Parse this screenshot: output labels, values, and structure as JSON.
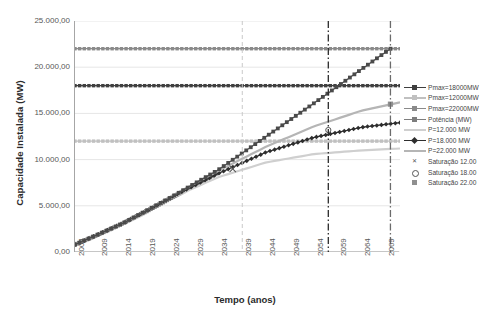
{
  "chart_data": {
    "type": "line",
    "title": "",
    "xlabel": "Tempo (anos)",
    "ylabel": "Capacidade Instalada (MW)",
    "xlim": [
      2004,
      2072
    ],
    "ylim": [
      0,
      25000
    ],
    "grid": true,
    "legend_position": "right",
    "x_ticks": [
      "2004",
      "2009",
      "2014",
      "2019",
      "2024",
      "2029",
      "2034",
      "2039",
      "2044",
      "2049",
      "2054",
      "2059",
      "2064",
      "2069"
    ],
    "y_ticks": [
      "0,00",
      "5.000,00",
      "10.000,00",
      "15.000,00",
      "20.000,00",
      "25.000,00"
    ],
    "annotations": [
      {
        "name": "vertical-reference-2039",
        "x": 2039,
        "style": "dashed",
        "color": "#c9c9c9"
      },
      {
        "name": "vertical-reference-2057",
        "x": 2057,
        "style": "dash-dot",
        "color": "#2b2b2b"
      },
      {
        "name": "vertical-reference-2070",
        "x": 2070,
        "style": "dash-dot",
        "color": "#6b6b6b"
      }
    ],
    "series": [
      {
        "name": "Pmax=18000MW",
        "color": "#3f3f3f",
        "marker": "square",
        "type": "horizontal-line",
        "x": [
          2004,
          2072
        ],
        "values": [
          18000,
          18000
        ]
      },
      {
        "name": "Pmax=12000MW",
        "color": "#c0c0c0",
        "marker": "square",
        "type": "horizontal-line",
        "x": [
          2004,
          2072
        ],
        "values": [
          12000,
          12000
        ]
      },
      {
        "name": "Pmax=22000MW",
        "color": "#8a8a8a",
        "marker": "square",
        "type": "horizontal-line",
        "x": [
          2004,
          2072
        ],
        "values": [
          22000,
          22000
        ]
      },
      {
        "name": "Potência (MW)",
        "color": "#7d7d7d",
        "marker": "square",
        "type": "line",
        "x": [
          2004,
          2009,
          2014,
          2019,
          2024,
          2029,
          2034
        ],
        "values": [
          800,
          1900,
          3100,
          4400,
          5800,
          7200,
          8600
        ]
      },
      {
        "name": "P=12.000 MW",
        "color": "#cfcfcf",
        "marker": "none",
        "type": "line",
        "x": [
          2004,
          2014,
          2024,
          2034,
          2044,
          2054,
          2064,
          2072
        ],
        "values": [
          800,
          3100,
          5800,
          8100,
          9700,
          10600,
          11000,
          11200
        ]
      },
      {
        "name": "P=18.000 MW",
        "color": "#2e2e2e",
        "marker": "diamond",
        "type": "line",
        "x": [
          2004,
          2014,
          2024,
          2034,
          2044,
          2054,
          2064,
          2072
        ],
        "values": [
          800,
          3100,
          5900,
          8500,
          10800,
          12400,
          13500,
          14000
        ]
      },
      {
        "name": "P=22.000 MW",
        "color": "#b5b5b5",
        "marker": "none",
        "type": "line",
        "x": [
          2004,
          2014,
          2024,
          2034,
          2044,
          2054,
          2064,
          2072
        ],
        "values": [
          800,
          3100,
          6000,
          8800,
          11400,
          13600,
          15300,
          16200
        ]
      },
      {
        "name": "Saturação 12.000 MW",
        "color": "#555555",
        "marker": "x",
        "type": "point",
        "x": [
          2037
        ],
        "values": [
          9000
        ]
      },
      {
        "name": "Saturação 18.000 MW",
        "color": "#555555",
        "marker": "circle",
        "type": "point",
        "x": [
          2057
        ],
        "values": [
          13200
        ]
      },
      {
        "name": "Saturação 22.000 MW",
        "color": "#8f8f8f",
        "marker": "square",
        "type": "point",
        "x": [
          2070
        ],
        "values": [
          16000
        ]
      },
      {
        "name": "Correlação oriunda",
        "color": "#4a4a4a",
        "marker": "square",
        "type": "line",
        "x": [
          2004,
          2014,
          2024,
          2034,
          2044,
          2054,
          2064,
          2070
        ],
        "values": [
          800,
          3100,
          5900,
          8900,
          12500,
          16100,
          19800,
          22000
        ]
      }
    ]
  },
  "legend": {
    "items": [
      {
        "label": "Pmax=18000MW"
      },
      {
        "label": "Pmax=12000MW"
      },
      {
        "label": "Pmax=22000MW"
      },
      {
        "label": "Potência (MW)"
      },
      {
        "label": "P=12.000 MW"
      },
      {
        "label": "P=18.000 MW"
      },
      {
        "label": "P=22.000 MW"
      },
      {
        "label": "Saturação 12.00"
      },
      {
        "label": "Saturação 18.00"
      },
      {
        "label": "Saturação 22.00"
      },
      {
        "label": "Correlação oriun"
      }
    ]
  }
}
